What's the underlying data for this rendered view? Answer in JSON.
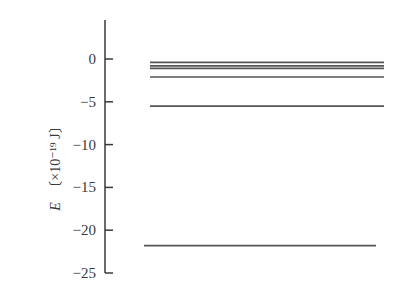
{
  "diagram": {
    "title": "",
    "type": "energy-level",
    "axis": {
      "label_symbol": "E",
      "label_unit": "〔×10⁻¹⁹ J〕",
      "ticks": [
        {
          "value": 0,
          "label": "0"
        },
        {
          "value": -5,
          "label": "−5"
        },
        {
          "value": -10,
          "label": "−10"
        },
        {
          "value": -15,
          "label": "−15"
        },
        {
          "value": -20,
          "label": "−20"
        },
        {
          "value": -25,
          "label": "−25"
        }
      ],
      "range": [
        4.5,
        -25
      ]
    },
    "levels": [
      {
        "value": -0.4
      },
      {
        "value": -0.8
      },
      {
        "value": -1.1
      },
      {
        "value": -2.1
      },
      {
        "value": -5.5
      },
      {
        "value": -21.8
      }
    ],
    "colors": {
      "axis": "#3a3a3a",
      "level": "#555555"
    }
  }
}
